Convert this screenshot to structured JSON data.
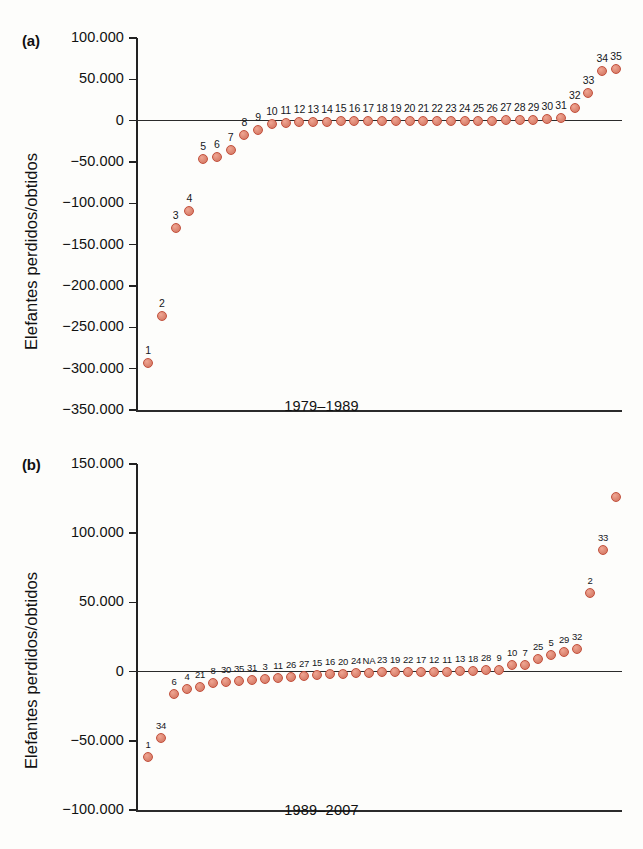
{
  "figure": {
    "panel_a_tag": "(a)",
    "panel_b_tag": "(b)",
    "y_axis_label": "Elefantes perdidos/obtidos",
    "marker_color": "#e08d79",
    "marker_edge_color": "#c2503c",
    "axis_color": "#2b2b2b"
  },
  "chart_data": [
    {
      "type": "scatter",
      "panel": "(a)",
      "title": "",
      "xlabel": "1979–1989",
      "ylabel": "Elefantes perdidos/obtidos",
      "ylim": [
        -350000,
        100000
      ],
      "ytick_labels": [
        "100.000",
        "50.000",
        "0",
        "−50.000",
        "−100.000",
        "−150.000",
        "−200.000",
        "−250.000",
        "−300.000",
        "−350.000"
      ],
      "ytick_values": [
        100000,
        50000,
        0,
        -50000,
        -100000,
        -150000,
        -200000,
        -250000,
        -300000,
        -350000
      ],
      "grid": false,
      "legend": "none",
      "point_labels": [
        "1",
        "2",
        "3",
        "4",
        "5",
        "6",
        "7",
        "8",
        "9",
        "10",
        "11",
        "12",
        "13",
        "14",
        "15",
        "16",
        "17",
        "18",
        "19",
        "20",
        "21",
        "22",
        "23",
        "24",
        "25",
        "26",
        "27",
        "28",
        "29",
        "30",
        "31",
        "32",
        "33",
        "34",
        "35"
      ],
      "values": [
        -293000,
        -236000,
        -130000,
        -109000,
        -46000,
        -44000,
        -35000,
        -17000,
        -11000,
        -4000,
        -3000,
        -2000,
        -1500,
        -1200,
        -800,
        -700,
        -600,
        -500,
        -400,
        -300,
        -200,
        -150,
        -100,
        0,
        100,
        200,
        300,
        400,
        600,
        2000,
        3500,
        15000,
        33000,
        60000,
        63000
      ]
    },
    {
      "type": "scatter",
      "panel": "(b)",
      "title": "",
      "xlabel": "1989–2007",
      "ylabel": "Elefantes perdidos/obtidos",
      "ylim": [
        -100000,
        150000
      ],
      "ytick_labels": [
        "150.000",
        "100.000",
        "50.000",
        "0",
        "−50.000",
        "−100.000"
      ],
      "ytick_values": [
        150000,
        100000,
        50000,
        0,
        -50000,
        -100000
      ],
      "grid": false,
      "legend": "none",
      "point_labels": [
        "1",
        "34",
        "6",
        "4",
        "21",
        "8",
        "30",
        "35",
        "31",
        "3",
        "11",
        "26",
        "27",
        "15",
        "16",
        "20",
        "24",
        "NA",
        "23",
        "19",
        "22",
        "17",
        "12",
        "11",
        "13",
        "18",
        "28",
        "9",
        "10",
        "7",
        "25",
        "5",
        "29",
        "32",
        "2",
        "33"
      ],
      "values": [
        -62000,
        -48000,
        -16500,
        -12500,
        -11000,
        -8000,
        -7500,
        -7000,
        -6000,
        -5000,
        -4500,
        -4000,
        -3000,
        -2500,
        -2000,
        -1500,
        -1000,
        -800,
        -600,
        -400,
        -300,
        -200,
        -100,
        0,
        200,
        500,
        800,
        1200,
        4500,
        5000,
        9000,
        12000,
        14500,
        16000,
        57000,
        88000,
        126000
      ]
    }
  ]
}
